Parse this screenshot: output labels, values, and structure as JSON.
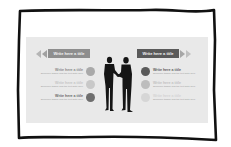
{
  "slide": {
    "left_title": "Write here a title",
    "right_title": "Write here a title",
    "left_items": [
      {
        "title": "Write here a title",
        "subtitle": "Someone tagline and the text write here",
        "title_color": "#8a8a8a",
        "circle_color": "#a9a9a9"
      },
      {
        "title": "Write here a title",
        "subtitle": "Someone tagline and the text write here",
        "title_color": "#c6c6c6",
        "circle_color": "#c8c8c8"
      },
      {
        "title": "Write here a title",
        "subtitle": "Someone tagline and the text write here",
        "title_color": "#6a6a6a",
        "circle_color": "#6e6e6e"
      }
    ],
    "right_items": [
      {
        "title": "Write here a title",
        "subtitle": "Someone tagline and the text write here",
        "title_color": "#5e5e5e",
        "circle_color": "#5a5a5a"
      },
      {
        "title": "Write here a title",
        "subtitle": "Someone tagline and the text write here",
        "title_color": "#c2c2c2",
        "circle_color": "#bdbdbd"
      },
      {
        "title": "Write here a title",
        "subtitle": "Someone tagline and the text write here",
        "title_color": "#d4d4d4",
        "circle_color": "#d6d6d6"
      }
    ],
    "center_icon": "handshake-silhouette-icon"
  },
  "colors": {
    "slide_bg": "#e9e9e9",
    "frame": "#111111",
    "left_ribbon": "#8e8e8e",
    "right_ribbon": "#5a5a5a",
    "silhouette": "#151515"
  }
}
